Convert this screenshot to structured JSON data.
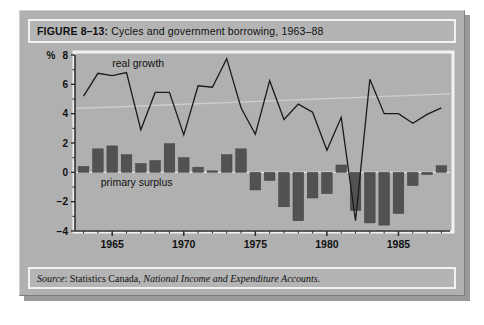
{
  "figure": {
    "label": "FIGURE 8–13:",
    "title": "Cycles and government borrowing, 1963–88",
    "source_prefix": "Source",
    "source_body": ": Statistics Canada, ",
    "source_publication": "National Income and Expenditure Accounts."
  },
  "colors": {
    "panel_background": "#b0b0b0",
    "plot_background": "#b4b4b4",
    "bar_fill": "#525252",
    "line_stroke": "#1a1a1a",
    "axis": "#2b2b2b",
    "band_border": "#f2f2f2",
    "shadow": "#9a9a9a"
  },
  "chart_data": {
    "type": "bar",
    "title": "Cycles and government borrowing, 1963–88",
    "xlabel": "",
    "ylabel": "%",
    "ylim": [
      -4,
      8
    ],
    "yticks": [
      -4,
      -2,
      0,
      2,
      4,
      6,
      8
    ],
    "ytick_labels": [
      "−4",
      "−2",
      "0",
      "2",
      "4",
      "6",
      "8"
    ],
    "y_unit_label": "%",
    "xlim": [
      1962.4,
      1988.6
    ],
    "xticks": [
      1965,
      1970,
      1975,
      1980,
      1985
    ],
    "xtick_labels": [
      "1965",
      "1970",
      "1975",
      "1980",
      "1985"
    ],
    "grid": false,
    "legend_position": "inline-annotations",
    "annotations": [
      {
        "text": "real growth",
        "x": 1965.0,
        "y": 7.2
      },
      {
        "text": "primary surplus",
        "x": 1964.2,
        "y": -0.95
      }
    ],
    "x": [
      1963,
      1964,
      1965,
      1966,
      1967,
      1968,
      1969,
      1970,
      1971,
      1972,
      1973,
      1974,
      1975,
      1976,
      1977,
      1978,
      1979,
      1980,
      1981,
      1982,
      1983,
      1984,
      1985,
      1986,
      1987,
      1988
    ],
    "series": [
      {
        "name": "primary surplus",
        "type": "bar",
        "values": [
          0.4,
          1.6,
          1.8,
          1.2,
          0.6,
          0.8,
          1.95,
          1.0,
          0.35,
          0.1,
          1.2,
          1.6,
          -1.2,
          -0.55,
          -2.35,
          -3.3,
          -1.75,
          -1.45,
          0.5,
          -2.6,
          -3.45,
          -3.6,
          -2.8,
          -0.9,
          -0.15,
          0.45
        ]
      },
      {
        "name": "real growth",
        "type": "line",
        "values": [
          5.2,
          6.75,
          6.6,
          6.8,
          2.9,
          5.45,
          5.45,
          2.55,
          5.9,
          5.8,
          7.75,
          4.4,
          2.6,
          6.25,
          3.6,
          4.65,
          4.1,
          1.5,
          3.75,
          -3.3,
          6.35,
          4.0,
          4.0,
          3.35,
          3.95,
          4.4
        ]
      }
    ]
  }
}
